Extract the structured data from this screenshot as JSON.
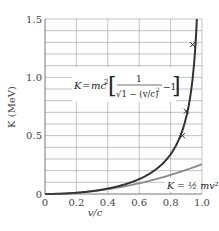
{
  "chart_data": {
    "type": "line",
    "title": "",
    "xlabel": "v/c",
    "ylabel": "K (MeV)",
    "xlim": [
      0,
      1.0
    ],
    "ylim": [
      0,
      1.5
    ],
    "x_ticks": [
      "0",
      "0.2",
      "0.4",
      "0.6",
      "0.8",
      "1.0"
    ],
    "y_ticks": [
      "0",
      "0.5",
      "1.0",
      "1.5"
    ],
    "grid": true,
    "grid_x_step": 0.2,
    "grid_y_step": 0.1,
    "rest_energy_mev": 0.511,
    "series": [
      {
        "name": "relativistic",
        "label_parts": {
          "lhs": "K = mc",
          "sup": "2",
          "num": "1",
          "den": "√1 − (v/c)",
          "den_sup": "2",
          "tail": "−1"
        },
        "color": "#333333",
        "x": [
          0,
          0.1,
          0.2,
          0.3,
          0.4,
          0.5,
          0.6,
          0.7,
          0.75,
          0.8,
          0.85,
          0.875,
          0.9,
          0.92,
          0.94,
          0.95,
          0.96
        ],
        "values": [
          0,
          0.0026,
          0.0105,
          0.0247,
          0.0465,
          0.0791,
          0.1278,
          0.2045,
          0.2616,
          0.3407,
          0.459,
          0.5442,
          0.6613,
          0.7928,
          0.9866,
          1.1255,
          1.3143
        ]
      },
      {
        "name": "classical",
        "label": "K = ½ mv²",
        "color": "#8a8a8a",
        "x": [
          0,
          0.2,
          0.4,
          0.6,
          0.8,
          1.0
        ],
        "values": [
          0,
          0.0102,
          0.0409,
          0.092,
          0.1635,
          0.2555
        ]
      },
      {
        "name": "experimental points",
        "marker": "x",
        "color": "#333333",
        "x": [
          0.875,
          0.9,
          0.94
        ],
        "values": [
          0.5,
          0.71,
          1.28
        ]
      }
    ]
  },
  "labels": {
    "ylabel": "K (MeV)",
    "xlabel": "v/c",
    "relativistic_formula": "K = mc²[1/√(1 − (v/c)²) − 1]",
    "classical_formula": "K = ½ mv²"
  }
}
